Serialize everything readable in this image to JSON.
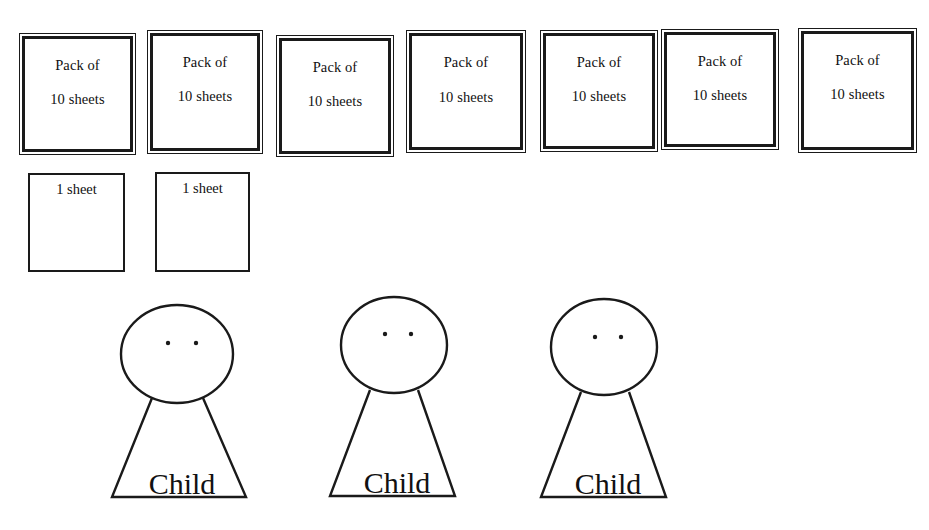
{
  "scene": {
    "width": 929,
    "height": 530,
    "background_color": "#ffffff",
    "stroke_color": "#1a1a1a",
    "text_color": "#111111",
    "description": "Place-value manipulative drawing: seven packs of ten sheets, two single sheets, and three children"
  },
  "packs": {
    "count": 7,
    "line1": "Pack of",
    "line2": "10 sheets",
    "items": [
      {
        "id": "pack-1",
        "line1": "Pack of",
        "line2": "10 sheets",
        "x": 19,
        "y": 33,
        "w": 117,
        "h": 122
      },
      {
        "id": "pack-2",
        "line1": "Pack of",
        "line2": "10 sheets",
        "x": 147,
        "y": 30,
        "w": 116,
        "h": 124
      },
      {
        "id": "pack-3",
        "line1": "Pack of",
        "line2": "10 sheets",
        "x": 276,
        "y": 35,
        "w": 118,
        "h": 122
      },
      {
        "id": "pack-4",
        "line1": "Pack of",
        "line2": "10 sheets",
        "x": 406,
        "y": 30,
        "w": 120,
        "h": 123
      },
      {
        "id": "pack-5",
        "line1": "Pack of",
        "line2": "10 sheets",
        "x": 540,
        "y": 30,
        "w": 118,
        "h": 122
      },
      {
        "id": "pack-6",
        "line1": "Pack of",
        "line2": "10 sheets",
        "x": 661,
        "y": 29,
        "w": 118,
        "h": 121
      },
      {
        "id": "pack-7",
        "line1": "Pack of",
        "line2": "10 sheets",
        "x": 798,
        "y": 28,
        "w": 119,
        "h": 125
      }
    ]
  },
  "single_sheets": {
    "count": 2,
    "label": "1 sheet",
    "items": [
      {
        "id": "sheet-1",
        "label": "1 sheet",
        "x": 28,
        "y": 173,
        "w": 97,
        "h": 99
      },
      {
        "id": "sheet-2",
        "label": "1 sheet",
        "x": 155,
        "y": 172,
        "w": 95,
        "h": 100
      }
    ]
  },
  "children": {
    "count": 3,
    "label": "Child",
    "items": [
      {
        "id": "child-1",
        "label": "Child",
        "head": {
          "cx": 177,
          "cy": 354,
          "rx": 56,
          "ry": 49
        },
        "eyes": [
          {
            "cx": 168,
            "cy": 343
          },
          {
            "cx": 196,
            "cy": 343
          }
        ],
        "body": {
          "apex_left": 152,
          "apex_right": 203,
          "apex_y": 398,
          "base_left": 112,
          "base_right": 246,
          "base_y": 497
        },
        "text": {
          "x": 182,
          "y": 494,
          "size": 30
        }
      },
      {
        "id": "child-2",
        "label": "Child",
        "head": {
          "cx": 394,
          "cy": 345,
          "rx": 53,
          "ry": 48
        },
        "eyes": [
          {
            "cx": 385,
            "cy": 334
          },
          {
            "cx": 411,
            "cy": 334
          }
        ],
        "body": {
          "apex_left": 370,
          "apex_right": 418,
          "apex_y": 390,
          "base_left": 330,
          "base_right": 455,
          "base_y": 496
        },
        "text": {
          "x": 397,
          "y": 493,
          "size": 30
        }
      },
      {
        "id": "child-3",
        "label": "Child",
        "head": {
          "cx": 604,
          "cy": 347,
          "rx": 53,
          "ry": 48
        },
        "eyes": [
          {
            "cx": 595,
            "cy": 337
          },
          {
            "cx": 621,
            "cy": 337
          }
        ],
        "body": {
          "apex_left": 581,
          "apex_right": 629,
          "apex_y": 392,
          "base_left": 541,
          "base_right": 666,
          "base_y": 497
        },
        "text": {
          "x": 608,
          "y": 494,
          "size": 30
        }
      }
    ]
  }
}
